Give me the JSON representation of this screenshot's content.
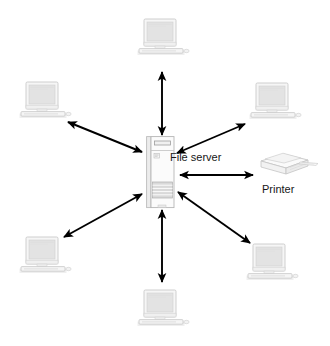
{
  "diagram": {
    "type": "star-topology-network-diagram",
    "title": "",
    "center": {
      "id": "file-server",
      "label": "File server",
      "device": "server-tower",
      "x": 160,
      "y": 172
    },
    "peripherals": [
      {
        "id": "printer",
        "label": "Printer",
        "device": "printer",
        "x": 288,
        "y": 168,
        "link": "bidirectional"
      }
    ],
    "workstations": [
      {
        "id": "workstation-top",
        "label": "",
        "device": "desktop-computer",
        "x": 163,
        "y": 40,
        "link": "bidirectional"
      },
      {
        "id": "workstation-top-left",
        "label": "",
        "device": "desktop-computer",
        "x": 45,
        "y": 103,
        "link": "bidirectional"
      },
      {
        "id": "workstation-top-right",
        "label": "",
        "device": "desktop-computer",
        "x": 275,
        "y": 104,
        "link": "bidirectional"
      },
      {
        "id": "workstation-bottom-left",
        "label": "",
        "device": "desktop-computer",
        "x": 45,
        "y": 258,
        "link": "bidirectional"
      },
      {
        "id": "workstation-bottom-right",
        "label": "",
        "device": "desktop-computer",
        "x": 272,
        "y": 265,
        "link": "bidirectional"
      },
      {
        "id": "workstation-bottom",
        "label": "",
        "device": "desktop-computer",
        "x": 163,
        "y": 311,
        "link": "bidirectional"
      }
    ],
    "connections": [
      {
        "from": "file-server",
        "to": "workstation-top",
        "style": "double-headed-arrow"
      },
      {
        "from": "file-server",
        "to": "workstation-top-left",
        "style": "double-headed-arrow"
      },
      {
        "from": "file-server",
        "to": "workstation-top-right",
        "style": "double-headed-arrow"
      },
      {
        "from": "file-server",
        "to": "printer",
        "style": "double-headed-arrow"
      },
      {
        "from": "file-server",
        "to": "workstation-bottom-left",
        "style": "double-headed-arrow"
      },
      {
        "from": "file-server",
        "to": "workstation-bottom-right",
        "style": "double-headed-arrow"
      },
      {
        "from": "file-server",
        "to": "workstation-bottom",
        "style": "double-headed-arrow"
      }
    ],
    "caption": "",
    "colors": {
      "background": "#ffffff",
      "arrow": "#000000",
      "text": "#161616",
      "device_outline": "#bcbcbc",
      "device_fill": "#f4f4f4",
      "screen_fill": "#e2e2e2",
      "server_bay": "#d2d2d2"
    }
  }
}
